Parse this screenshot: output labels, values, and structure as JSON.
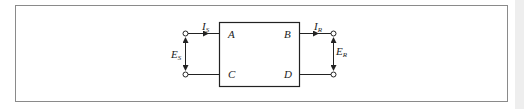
{
  "diagram": {
    "block_labels": {
      "top_left": "A",
      "top_right": "B",
      "bottom_left": "C",
      "bottom_right": "D"
    },
    "sending_current": {
      "main": "I",
      "sub": "S"
    },
    "receiving_current": {
      "main": "I",
      "sub": "R"
    },
    "sending_voltage": {
      "main": "E",
      "sub": "S"
    },
    "receiving_voltage": {
      "main": "E",
      "sub": "R"
    },
    "colors": {
      "line": "#222222",
      "frame": "#8a8a8a",
      "side_strip": "#eeeeee"
    }
  }
}
